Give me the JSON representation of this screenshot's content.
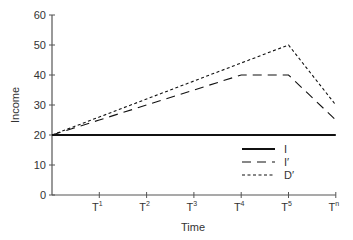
{
  "chart_data": {
    "type": "line",
    "title": "",
    "xlabel": "Time",
    "ylabel": "Income",
    "ylim": [
      0,
      60
    ],
    "yticks": [
      0,
      10,
      20,
      30,
      40,
      50,
      60
    ],
    "categories": [
      "T0",
      "T1",
      "T2",
      "T3",
      "T4",
      "T5",
      "Tn"
    ],
    "x_tick_labels": [
      {
        "base": "T",
        "sup": "1"
      },
      {
        "base": "T",
        "sup": "2"
      },
      {
        "base": "T",
        "sup": "3"
      },
      {
        "base": "T",
        "sup": "4"
      },
      {
        "base": "T",
        "sup": "5"
      },
      {
        "base": "T",
        "sup": "n"
      }
    ],
    "grid": false,
    "legend_position": "lower right",
    "series": [
      {
        "name": "I",
        "style": "solid",
        "values": [
          20,
          20,
          20,
          20,
          20,
          20,
          20
        ]
      },
      {
        "name": "I′",
        "style": "long-dash",
        "values": [
          20,
          25,
          30,
          35,
          40,
          40,
          25
        ]
      },
      {
        "name": "D′",
        "style": "short-dash",
        "values": [
          20,
          26,
          32,
          38,
          44,
          50,
          30
        ]
      }
    ]
  }
}
